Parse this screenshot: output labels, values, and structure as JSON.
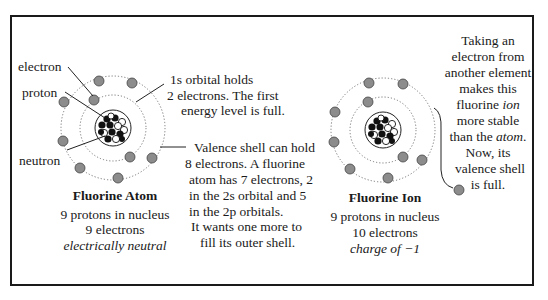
{
  "labels": {
    "electron": "electron",
    "proton": "proton",
    "neutron": "neutron"
  },
  "notes": {
    "orbital_1s": [
      "1s orbital holds",
      "2 electrons.  The first",
      "energy level is full."
    ],
    "valence": [
      "Valence shell can hold",
      "8 electrons.  A fluorine",
      "atom has 7 electrons, 2",
      "in the 2s orbital and 5",
      "in the 2p orbitals.",
      "It wants one more to",
      "fill its outer shell."
    ],
    "ion_note": {
      "line1": "Taking an",
      "line2": "electron from",
      "line3": "another element",
      "line4": "makes this",
      "line5_pre": "fluorine ",
      "line5_ital": "ion",
      "line6": "more stable",
      "line7_pre": "than the ",
      "line7_ital": "atom",
      "line7_post": ".",
      "line8": "Now, its",
      "line9": "valence shell",
      "line10": "is full."
    }
  },
  "atom": {
    "title": "Fluorine Atom",
    "protons": "9 protons in nucleus",
    "electrons": "9 electrons",
    "charge": "electrically neutral"
  },
  "ion": {
    "title": "Fluorine Ion",
    "protons": "9 protons in nucleus",
    "electrons": "10 electrons",
    "charge": "charge of −1"
  },
  "colors": {
    "electron_fill": "#8c8c8c",
    "border": "#1a1a1a",
    "proton": "#111111",
    "neutron": "#ffffff"
  }
}
